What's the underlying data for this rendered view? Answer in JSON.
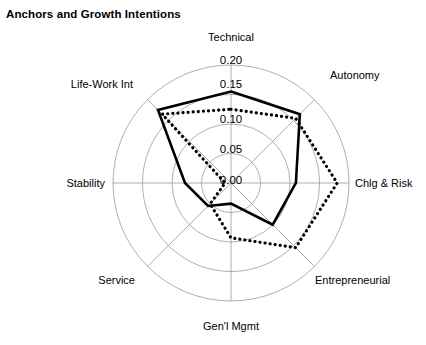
{
  "chart_data": {
    "type": "radar",
    "title": "Anchors and Growth Intentions",
    "categories": [
      "Technical",
      "Autonomy",
      "Chlg & Risk",
      "Entrepreneurial",
      "Gen'l Mgmt",
      "Service",
      "Stability",
      "Life-Work Int"
    ],
    "radial_ticks": [
      "0.20",
      "0.15",
      "0.10",
      "0.05",
      "0.00"
    ],
    "radial_tick_values": [
      0.2,
      0.15,
      0.1,
      0.05,
      0.0
    ],
    "rlim": [
      0.0,
      0.2
    ],
    "grid": true,
    "legend": "none",
    "xlabel": "",
    "ylabel": "",
    "series": [
      {
        "name": "solid",
        "style": "solid",
        "color": "#000000",
        "values": [
          0.155,
          0.165,
          0.11,
          0.1,
          0.035,
          0.055,
          0.078,
          0.175
        ]
      },
      {
        "name": "dotted",
        "style": "dotted",
        "color": "#000000",
        "values": [
          0.125,
          0.155,
          0.18,
          0.155,
          0.093,
          0.05,
          0.01,
          0.165
        ]
      }
    ]
  },
  "geometry": {
    "cx": 231,
    "cy": 183,
    "radius": 118,
    "start_angle_deg": -90
  },
  "axis_label_positions": [
    {
      "label": "Technical",
      "x": 231,
      "y": 41,
      "anchor": "middle"
    },
    {
      "label": "Autonomy",
      "x": 330,
      "y": 79,
      "anchor": "start"
    },
    {
      "label": "Chlg & Risk",
      "x": 355,
      "y": 187,
      "anchor": "start"
    },
    {
      "label": "Entrepreneurial",
      "x": 315,
      "y": 284,
      "anchor": "start"
    },
    {
      "label": "Gen'l Mgmt",
      "x": 231,
      "y": 330,
      "anchor": "middle"
    },
    {
      "label": "Service",
      "x": 135,
      "y": 284,
      "anchor": "end"
    },
    {
      "label": "Stability",
      "x": 105,
      "y": 187,
      "anchor": "end"
    },
    {
      "label": "Life-Work Int",
      "x": 133,
      "y": 88,
      "anchor": "end"
    }
  ],
  "radial_label_positions": [
    {
      "label": "0.20",
      "x": 231,
      "y": 64
    },
    {
      "label": "0.15",
      "x": 231,
      "y": 88
    },
    {
      "label": "0.10",
      "x": 231,
      "y": 123
    },
    {
      "label": "0.05",
      "x": 231,
      "y": 153
    },
    {
      "label": "0.00",
      "x": 231,
      "y": 184
    }
  ]
}
